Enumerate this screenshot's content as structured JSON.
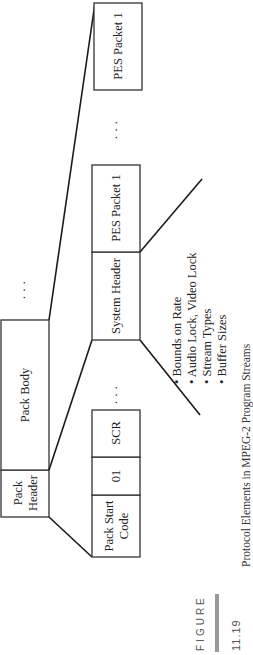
{
  "figure": {
    "label": "FIGURE",
    "number": "11.19",
    "caption": "Protocol Elements in MPEG-2 Program Streams",
    "bar_color": "#999999"
  },
  "pack": {
    "header": [
      "Pack",
      "Header"
    ],
    "body": "Pack Body",
    "ellipsis": "· · ·"
  },
  "header_fields": {
    "start_code": [
      "Pack Start",
      "Code"
    ],
    "marker": "01",
    "scr": "SCR",
    "ellipsis": "· · ·"
  },
  "body_fields": {
    "system_header": "System Header",
    "pes_first": "PES Packet 1",
    "ellipsis": "· · ·",
    "pes_last": "PES Packet 1"
  },
  "system_header_contents": [
    "• Bounds on Rate",
    "• Audio Lock, Video Lock",
    "• Stream Types",
    "• Buffer Sizes"
  ]
}
